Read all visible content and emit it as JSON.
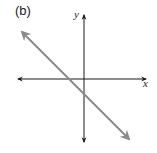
{
  "figure": {
    "panel_label": "(b)",
    "x_axis_label": "x",
    "y_axis_label": "y",
    "colors": {
      "axes": "#1a1a1a",
      "line": "#8a8a8a",
      "text": "#222222",
      "background": "#ffffff"
    },
    "axes": {
      "origin_px": [
        84,
        79
      ],
      "x_axis_px": {
        "from": [
          17,
          79
        ],
        "to": [
          147,
          79
        ],
        "arrows": "both"
      },
      "y_axis_px": {
        "from": [
          84,
          14
        ],
        "to": [
          84,
          143
        ],
        "arrows": "both"
      }
    },
    "line": {
      "description": "straight line with negative slope, double-headed arrows",
      "from_px": [
        20,
        30
      ],
      "to_px": [
        131,
        141
      ],
      "slope_sign": "negative",
      "x_intercept": "negative",
      "y_intercept": "negative"
    }
  }
}
